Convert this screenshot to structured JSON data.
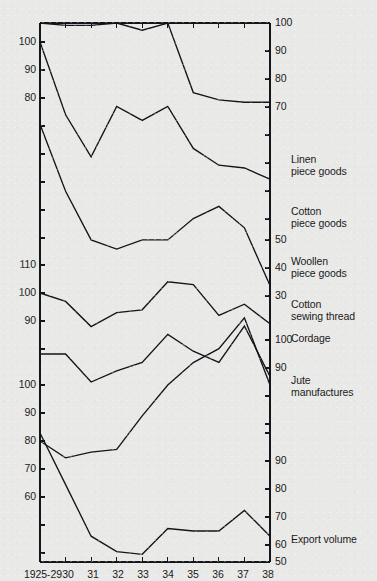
{
  "chart_data": {
    "type": "line",
    "title": "",
    "subtitle": "",
    "xlabel": "",
    "ylabel": "",
    "grid": false,
    "legend_position": "right",
    "note": "Multi-panel index chart: six separate index series share one time axis, each drawn in its own vertical band with its own offset scale. Base 1925-29 = 100 for several series.",
    "x": [
      "1925-29",
      "30",
      "31",
      "32",
      "33",
      "34",
      "35",
      "36",
      "37",
      "38"
    ],
    "x_tick_labels": [
      "1925-29",
      "30",
      "31",
      "32",
      "33",
      "34",
      "35",
      "36",
      "37",
      "38"
    ],
    "panels": [
      {
        "name": "Linen piece goods",
        "legend": "Linen\npiece goods",
        "axis_side": "right",
        "axis_ticks": [
          100,
          90,
          80,
          70
        ],
        "values": [
          100,
          99,
          99,
          100,
          97,
          100,
          71,
          68,
          67,
          67
        ]
      },
      {
        "name": "Cotton piece goods",
        "legend": "Cotton\npiece goods",
        "axis_side": "left",
        "axis_ticks": [
          100,
          90,
          80
        ],
        "values": [
          100,
          74,
          59,
          77,
          72,
          77,
          62,
          56,
          55,
          51
        ]
      },
      {
        "name": "Woollen piece goods",
        "legend": "Woollen\npiece goods",
        "axis_side": "right",
        "axis_ticks": [
          50,
          40,
          30
        ],
        "values": [
          86,
          64,
          48,
          45,
          48,
          48,
          55,
          59,
          52,
          33
        ]
      },
      {
        "name": "Cotton sewing thread",
        "legend": "Cotton\nsewing thread",
        "axis_side": "left",
        "axis_ticks": [
          110,
          100,
          90
        ],
        "values": [
          100,
          97,
          88,
          93,
          94,
          104,
          103,
          92,
          96,
          89
        ]
      },
      {
        "name": "Cordage",
        "legend": "Cordage",
        "axis_side": "right",
        "axis_ticks": [
          100,
          90
        ],
        "values": [
          100,
          100,
          90,
          94,
          97,
          107,
          101,
          97,
          110,
          92
        ]
      },
      {
        "name": "Jute manufactures",
        "legend": "Jute\nmanufactures",
        "axis_side": "left",
        "axis_ticks": [
          100,
          90,
          80,
          70,
          60
        ],
        "values": [
          80,
          74,
          76,
          77,
          89,
          100,
          108,
          113,
          124,
          100
        ]
      },
      {
        "name": "Export volume",
        "legend": "Export volume",
        "axis_side": "right",
        "axis_ticks": [
          90,
          80,
          70,
          60,
          50
        ],
        "values": [
          100,
          80,
          60,
          54,
          53,
          63,
          62,
          62,
          70,
          60
        ]
      }
    ]
  },
  "axes": {
    "left_ticks": [
      {
        "label": "100",
        "y": 42
      },
      {
        "label": "90",
        "y": 70
      },
      {
        "label": "80",
        "y": 98
      },
      {
        "label": "110",
        "y": 265
      },
      {
        "label": "100",
        "y": 293
      },
      {
        "label": "90",
        "y": 321
      },
      {
        "label": "100",
        "y": 385
      },
      {
        "label": "90",
        "y": 413
      },
      {
        "label": "80",
        "y": 441
      },
      {
        "label": "70",
        "y": 469
      },
      {
        "label": "60",
        "y": 497
      }
    ],
    "right_ticks": [
      {
        "label": "100",
        "y": 23
      },
      {
        "label": "90",
        "y": 51
      },
      {
        "label": "80",
        "y": 79
      },
      {
        "label": "70",
        "y": 107
      },
      {
        "label": "50",
        "y": 240
      },
      {
        "label": "40",
        "y": 268
      },
      {
        "label": "30",
        "y": 296
      },
      {
        "label": "100",
        "y": 340
      },
      {
        "label": "90",
        "y": 368
      },
      {
        "label": "90",
        "y": 461
      },
      {
        "label": "80",
        "y": 489
      },
      {
        "label": "70",
        "y": 517
      },
      {
        "label": "60",
        "y": 545
      },
      {
        "label": "50",
        "y": 562
      }
    ],
    "x_labels": [
      {
        "label": "1925-29",
        "x": 43
      },
      {
        "label": "30",
        "x": 68
      },
      {
        "label": "31",
        "x": 93
      },
      {
        "label": "32",
        "x": 118
      },
      {
        "label": "33",
        "x": 143
      },
      {
        "label": "34",
        "x": 168
      },
      {
        "label": "35",
        "x": 193
      },
      {
        "label": "36",
        "x": 218
      },
      {
        "label": "37",
        "x": 243
      },
      {
        "label": "38",
        "x": 268
      }
    ]
  },
  "legend_entries": [
    {
      "text": "Linen\npiece goods",
      "y": 160
    },
    {
      "text": "Cotton\npiece goods",
      "y": 212
    },
    {
      "text": "Woollen\npiece goods",
      "y": 262
    },
    {
      "text": "Cotton\nsewing thread",
      "y": 305
    },
    {
      "text": "Cordage",
      "y": 339
    },
    {
      "text": "Jute\nmanufactures",
      "y": 381
    },
    {
      "text": "Export volume",
      "y": 540
    }
  ],
  "colors": {
    "background": "#e9e9e7",
    "ink": "#141518"
  }
}
